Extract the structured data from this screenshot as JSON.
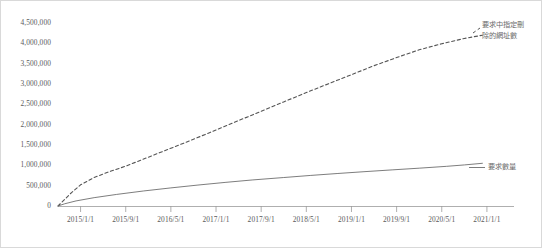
{
  "chart_data": {
    "type": "line",
    "title": "",
    "subtitle": "",
    "xlabel": "",
    "ylabel": "",
    "grid": false,
    "legend_position": "inline-right-of-series",
    "ylim": [
      0,
      4500000
    ],
    "y_ticks": [
      "0",
      "500,000",
      "1,000,000",
      "1,500,000",
      "2,000,000",
      "2,500,000",
      "3,000,000",
      "3,500,000",
      "4,000,000",
      "4,500,000"
    ],
    "y_tick_values": [
      0,
      500000,
      1000000,
      1500000,
      2000000,
      2500000,
      3000000,
      3500000,
      4000000,
      4500000
    ],
    "x_ticks": [
      "2015/1/1",
      "2015/9/1",
      "2016/5/1",
      "2017/1/1",
      "2017/9/1",
      "2018/5/1",
      "2019/1/1",
      "2019/9/1",
      "2020/5/1",
      "2021/1/1"
    ],
    "x_tick_positions": [
      0.5,
      1.5,
      2.5,
      3.5,
      4.5,
      5.5,
      6.5,
      7.5,
      8.5,
      9.5
    ],
    "xlim": [
      0,
      10.1
    ],
    "series": [
      {
        "name": "要求中指定刪除的網址數",
        "label_lines": [
          "要求中指定刪",
          "除的網址數"
        ],
        "style": "dashed",
        "color": "#555555",
        "x": [
          0.0,
          0.12,
          0.3,
          0.5,
          0.8,
          1.1,
          1.5,
          2.0,
          2.5,
          3.0,
          3.5,
          4.0,
          4.5,
          5.0,
          5.5,
          6.0,
          6.5,
          7.0,
          7.5,
          8.0,
          8.5,
          9.0,
          9.4
        ],
        "values": [
          0,
          130000,
          330000,
          520000,
          700000,
          830000,
          980000,
          1200000,
          1420000,
          1640000,
          1870000,
          2100000,
          2330000,
          2560000,
          2790000,
          3010000,
          3230000,
          3450000,
          3650000,
          3840000,
          3990000,
          4120000,
          4200000
        ]
      },
      {
        "name": "要求數量",
        "label_lines": [
          "要求數量"
        ],
        "style": "solid",
        "color": "#6e6e6e",
        "x": [
          0.0,
          0.15,
          0.4,
          0.8,
          1.3,
          1.9,
          2.5,
          3.1,
          3.7,
          4.3,
          5.0,
          5.6,
          6.2,
          6.8,
          7.4,
          8.0,
          8.6,
          9.0,
          9.4
        ],
        "values": [
          0,
          55000,
          125000,
          205000,
          285000,
          370000,
          445000,
          515000,
          580000,
          640000,
          700000,
          752000,
          800000,
          845000,
          888000,
          930000,
          975000,
          1010000,
          1050000
        ]
      }
    ]
  }
}
